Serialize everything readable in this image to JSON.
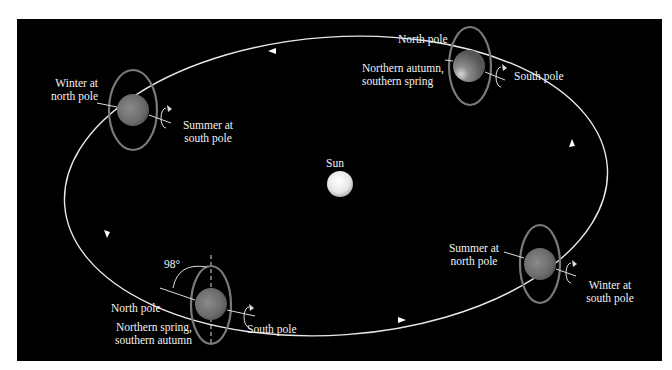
{
  "diagram": {
    "background_color": "#000000",
    "orbit_color": "#e8e8e8",
    "ring_color": "#7a7a7a",
    "planet_color": "#6e6e6e",
    "sun": {
      "label": "Sun",
      "color": "#f0f0f0"
    },
    "positions": [
      {
        "id": "top-left",
        "season_label_line1": "Winter at",
        "season_label_line2": "north pole",
        "pole_label_line1": "Summer at",
        "pole_label_line2": "south pole"
      },
      {
        "id": "top-right",
        "north_label": "North pole",
        "season_label_line1": "Northern autumn,",
        "season_label_line2": "southern spring",
        "pole_label": "South pole"
      },
      {
        "id": "bottom-left",
        "angle_label": "98°",
        "north_label": "North pole",
        "season_label_line1": "Northern spring,",
        "season_label_line2": "southern autumn",
        "pole_label": "South pole"
      },
      {
        "id": "bottom-right",
        "season_label_line1": "Summer at",
        "season_label_line2": "north pole",
        "pole_label_line1": "Winter at",
        "pole_label_line2": "south pole"
      }
    ]
  }
}
